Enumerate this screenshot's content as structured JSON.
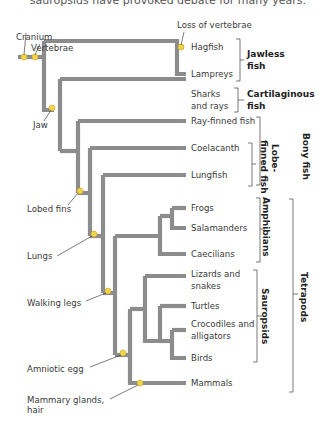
{
  "caption": "sauropsids have provoked debate for many years.",
  "taxa": [
    "Hagfish",
    "Lampreys",
    "Sharks",
    "and rays",
    "Ray-finned fish",
    "Coelacanth",
    "Lungfish",
    "Frogs",
    "Salamanders",
    "Caecilians",
    "Lizards and",
    "snakes",
    "Turtles",
    "Crocodiles and",
    "alligators",
    "Birds",
    "Mammals"
  ],
  "traits": {
    "cranium": "Cranium",
    "vertebrae": "Vertebrae",
    "loss_vertebrae": "Loss of vertebrae",
    "jaw": "Jaw",
    "lobed_fins": "Lobed fins",
    "lungs": "Lungs",
    "walking_legs": "Walking legs",
    "amniotic_egg": "Amniotic egg",
    "mammary_1": "Mammary glands,",
    "mammary_2": "hair"
  },
  "groups": {
    "jawless_1": "Jawless",
    "jawless_2": "fish",
    "cart_1": "Cartilaginous",
    "cart_2": "fish",
    "bony": "Bony fish",
    "lobe_1": "Lobe-",
    "lobe_2": "finned fish",
    "amphibians": "Amphibians",
    "sauropsids": "Sauropsids",
    "tetrapods": "Tetrapods"
  },
  "colors": {
    "branch": "#8c8c8c",
    "node": "#f2d44a",
    "text": "#3a3a3a"
  }
}
